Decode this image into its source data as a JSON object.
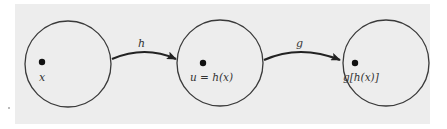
{
  "diagram": {
    "nodes": [
      {
        "id": "domain",
        "label": "x",
        "cx": 68,
        "cy": 64,
        "r": 43
      },
      {
        "id": "middle",
        "label": "u = h(x)",
        "cx": 220,
        "cy": 63,
        "r": 43
      },
      {
        "id": "range",
        "label": "g[h(x)]",
        "cx": 386,
        "cy": 63,
        "r": 43
      }
    ],
    "edges": [
      {
        "from": "domain",
        "to": "middle",
        "label": "h"
      },
      {
        "from": "middle",
        "to": "range",
        "label": "g"
      }
    ],
    "colors": {
      "panel": "#ededed",
      "stroke": "#3a3a3a",
      "dot": "#111111"
    }
  }
}
